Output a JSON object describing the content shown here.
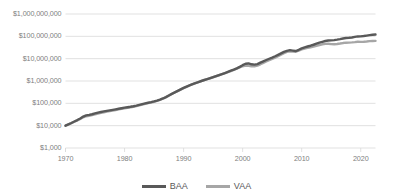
{
  "chart_data": {
    "type": "line",
    "title": "",
    "subtitle": "",
    "xlabel": "",
    "ylabel": "",
    "yscale": "log",
    "ylim": [
      1000,
      1000000000
    ],
    "xlim": [
      1970,
      2022.5
    ],
    "grid": true,
    "legend_position": "bottom",
    "ytick_labels": [
      "$1,000,000,000",
      "$100,000,000",
      "$10,000,000",
      "$1,000,000",
      "$100,000",
      "$10,000",
      "$1,000"
    ],
    "ytick_values": [
      1000000000,
      100000000,
      10000000,
      1000000,
      100000,
      10000,
      1000
    ],
    "xtick_labels": [
      "1970",
      "1980",
      "1990",
      "2000",
      "2010",
      "2020"
    ],
    "xtick_values": [
      1970,
      1980,
      1990,
      2000,
      2010,
      2020
    ],
    "series": [
      {
        "name": "BAA",
        "color": "#595959",
        "x": [
          1970,
          1970.5,
          1971,
          1971.5,
          1972,
          1972.5,
          1973,
          1973.5,
          1974,
          1974.5,
          1975,
          1975.5,
          1976,
          1976.5,
          1977,
          1977.5,
          1978,
          1978.5,
          1979,
          1979.5,
          1980,
          1980.5,
          1981,
          1981.5,
          1982,
          1982.5,
          1983,
          1983.5,
          1984,
          1984.5,
          1985,
          1985.5,
          1986,
          1986.5,
          1987,
          1987.5,
          1988,
          1988.5,
          1989,
          1989.5,
          1990,
          1990.5,
          1991,
          1991.5,
          1992,
          1992.5,
          1993,
          1993.5,
          1994,
          1994.5,
          1995,
          1995.5,
          1996,
          1996.5,
          1997,
          1997.5,
          1998,
          1998.5,
          1999,
          1999.5,
          2000,
          2000.5,
          2001,
          2001.5,
          2002,
          2002.5,
          2003,
          2003.5,
          2004,
          2004.5,
          2005,
          2005.5,
          2006,
          2006.5,
          2007,
          2007.5,
          2008,
          2008.5,
          2009,
          2009.5,
          2010,
          2010.5,
          2011,
          2011.5,
          2012,
          2012.5,
          2013,
          2013.5,
          2014,
          2014.5,
          2015,
          2015.5,
          2016,
          2016.5,
          2017,
          2017.5,
          2018,
          2018.5,
          2019,
          2019.5,
          2020,
          2020.5,
          2021,
          2021.5,
          2022,
          2022.5
        ],
        "values": [
          10000,
          11500,
          13200,
          15400,
          17800,
          21000,
          25500,
          29000,
          30500,
          32500,
          35500,
          38500,
          41000,
          43500,
          46000,
          48500,
          51000,
          54000,
          57000,
          60500,
          64000,
          67000,
          70000,
          74000,
          79000,
          85000,
          92000,
          99000,
          106000,
          113000,
          122000,
          133000,
          147000,
          165000,
          190000,
          225000,
          265000,
          310000,
          360000,
          420000,
          490000,
          560000,
          640000,
          720000,
          810000,
          900000,
          1000000,
          1110000,
          1220000,
          1340000,
          1480000,
          1640000,
          1830000,
          2040000,
          2280000,
          2560000,
          2880000,
          3250000,
          3700000,
          4300000,
          5100000,
          5900000,
          6100000,
          5600000,
          5400000,
          5700000,
          6600000,
          7600000,
          8700000,
          9900000,
          11200000,
          12800000,
          14800000,
          17200000,
          20000000,
          22500000,
          24000000,
          23000000,
          22000000,
          25000000,
          29000000,
          32000000,
          35000000,
          38000000,
          42000000,
          47000000,
          52000000,
          57000000,
          62000000,
          65000000,
          66000000,
          68000000,
          71000000,
          75000000,
          80000000,
          84000000,
          86000000,
          89000000,
          94000000,
          99000000,
          100000000,
          103000000,
          108000000,
          113000000,
          118000000,
          120000000
        ]
      },
      {
        "name": "VAA",
        "color": "#A6A6A6",
        "x": [
          1970,
          1970.5,
          1971,
          1971.5,
          1972,
          1972.5,
          1973,
          1973.5,
          1974,
          1974.5,
          1975,
          1975.5,
          1976,
          1976.5,
          1977,
          1977.5,
          1978,
          1978.5,
          1979,
          1979.5,
          1980,
          1980.5,
          1981,
          1981.5,
          1982,
          1982.5,
          1983,
          1983.5,
          1984,
          1984.5,
          1985,
          1985.5,
          1986,
          1986.5,
          1987,
          1987.5,
          1988,
          1988.5,
          1989,
          1989.5,
          1990,
          1990.5,
          1991,
          1991.5,
          1992,
          1992.5,
          1993,
          1993.5,
          1994,
          1994.5,
          1995,
          1995.5,
          1996,
          1996.5,
          1997,
          1997.5,
          1998,
          1998.5,
          1999,
          1999.5,
          2000,
          2000.5,
          2001,
          2001.5,
          2002,
          2002.5,
          2003,
          2003.5,
          2004,
          2004.5,
          2005,
          2005.5,
          2006,
          2006.5,
          2007,
          2007.5,
          2008,
          2008.5,
          2009,
          2009.5,
          2010,
          2010.5,
          2011,
          2011.5,
          2012,
          2012.5,
          2013,
          2013.5,
          2014,
          2014.5,
          2015,
          2015.5,
          2016,
          2016.5,
          2017,
          2017.5,
          2018,
          2018.5,
          2019,
          2019.5,
          2020,
          2020.5,
          2021,
          2021.5,
          2022,
          2022.5
        ],
        "values": [
          10000,
          11400,
          13000,
          15000,
          17200,
          20000,
          23800,
          26500,
          27800,
          29500,
          32000,
          35000,
          37500,
          40000,
          42500,
          45000,
          47500,
          50500,
          53500,
          57000,
          60000,
          63000,
          66500,
          70500,
          75500,
          81500,
          88000,
          95000,
          102000,
          109000,
          118000,
          129000,
          143000,
          161000,
          186000,
          222000,
          262000,
          305000,
          352000,
          410000,
          480000,
          550000,
          630000,
          710000,
          800000,
          890000,
          990000,
          1100000,
          1210000,
          1330000,
          1470000,
          1630000,
          1810000,
          2010000,
          2240000,
          2500000,
          2800000,
          3150000,
          3550000,
          4050000,
          4600000,
          4900000,
          4800000,
          4600000,
          4600000,
          4900000,
          5600000,
          6500000,
          7500000,
          8600000,
          9800000,
          11200000,
          13000000,
          15200000,
          17800000,
          20000000,
          21500000,
          21000000,
          20500000,
          23000000,
          26000000,
          28500000,
          30500000,
          32500000,
          35000000,
          38000000,
          41000000,
          44000000,
          46000000,
          46500000,
          45000000,
          44500000,
          45500000,
          47500000,
          50000000,
          52000000,
          52500000,
          53500000,
          55000000,
          57000000,
          56500000,
          57500000,
          59000000,
          61000000,
          62000000,
          62500000
        ]
      }
    ]
  },
  "legend": {
    "items": [
      {
        "label": "BAA",
        "color": "#595959"
      },
      {
        "label": "VAA",
        "color": "#A6A6A6"
      }
    ]
  }
}
